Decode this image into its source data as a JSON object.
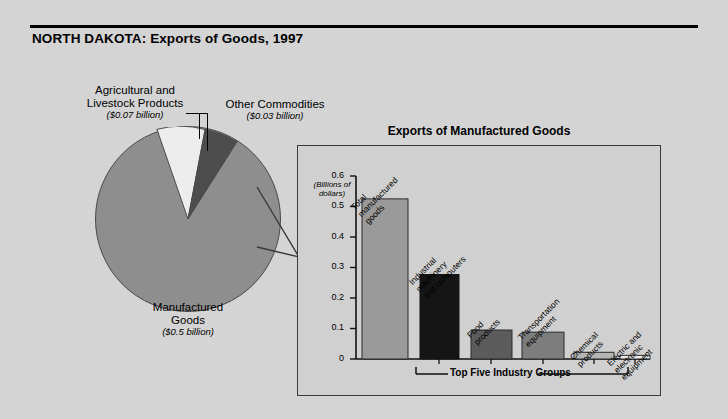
{
  "header": {
    "title": "NORTH DAKOTA: Exports of Goods, 1997"
  },
  "pie_labels": {
    "agricultural": {
      "name": "Agricultural and\nLivestock Products",
      "line1": "Agricultural and",
      "line2": "Livestock Products",
      "value": "($0.07 billion)"
    },
    "other": {
      "line1": "Other Commodities",
      "value": "($0.03 billion)"
    },
    "manufactured": {
      "line1": "Manufactured",
      "line2": "Goods",
      "value": "($0.5 billion)"
    }
  },
  "inset": {
    "title": "Exports of Manufactured Goods",
    "axis_note_line1": "(Billions of",
    "axis_note_line2": "dollars)",
    "bracket_label": "Top Five Industry Groups"
  },
  "chart_data": [
    {
      "type": "pie",
      "title": "NORTH DAKOTA: Exports of Goods, 1997",
      "unit": "billions of dollars",
      "categories": [
        "Manufactured Goods",
        "Agricultural and Livestock Products",
        "Other Commodities"
      ],
      "values": [
        0.5,
        0.07,
        0.03
      ],
      "value_labels": [
        "($0.5 billion)",
        "($0.07 billion)",
        "($0.03 billion)"
      ],
      "colors": [
        "#8e8e8e",
        "#ededed",
        "#4d4d4d"
      ],
      "legend": "none"
    },
    {
      "type": "bar",
      "title": "Exports of Manufactured Goods",
      "ylabel": "(Billions of dollars)",
      "xlabel": "",
      "ylim": [
        0,
        0.6
      ],
      "yticks": [
        "0",
        "0.1",
        "0.2",
        "0.3",
        "0.4",
        "0.5",
        "0.6"
      ],
      "ytick_values": [
        0,
        0.1,
        0.2,
        0.3,
        0.4,
        0.5,
        0.6
      ],
      "grid": false,
      "legend": "none",
      "categories": [
        "Total manufactured goods",
        "Industrial machinery and computers",
        "Food products",
        "Transportation equipment",
        "Chemical products",
        "Electric and electronic equipment"
      ],
      "category_lines": [
        [
          "Total",
          "manufactured",
          "goods"
        ],
        [
          "Industrial",
          "machinery",
          "and computers"
        ],
        [
          "Food",
          "products"
        ],
        [
          "Transportation",
          "equipment"
        ],
        [
          "Chemical",
          "products"
        ],
        [
          "Electric and",
          "electronic",
          "equipment"
        ]
      ],
      "values": [
        0.525,
        0.277,
        0.095,
        0.088,
        0.022,
        0.012
      ],
      "bar_colors": [
        "#9a9a9a",
        "#151515",
        "#5c5c5c",
        "#7d7d7d",
        "#b5b5b5",
        "#e8e8e8"
      ],
      "annotation": "Top Five Industry Groups",
      "annotation_span": [
        1,
        5
      ]
    }
  ],
  "colors": {
    "background": "#d4d4d4",
    "inset_background": "#d0d0d0",
    "outline": "#3a3a3a",
    "text": "#000000"
  }
}
